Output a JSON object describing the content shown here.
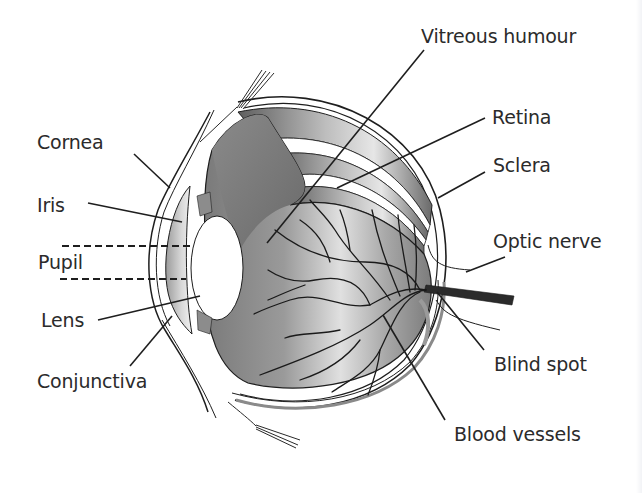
{
  "diagram": {
    "labels": {
      "vitreous_humour": "Vitreous humour",
      "retina": "Retina",
      "sclera": "Sclera",
      "optic_nerve": "Optic nerve",
      "blind_spot": "Blind spot",
      "blood_vessels": "Blood vessels",
      "cornea": "Cornea",
      "iris": "Iris",
      "pupil": "Pupil",
      "lens": "Lens",
      "conjunctiva": "Conjunctiva"
    },
    "colors": {
      "background": "#ffffff",
      "text": "#2b2b2b",
      "line": "#1e1e1e",
      "eyeball_dark": "#6e6e6e",
      "eyeball_light": "#d9d9d9",
      "vessel": "#1a1a1a"
    }
  }
}
